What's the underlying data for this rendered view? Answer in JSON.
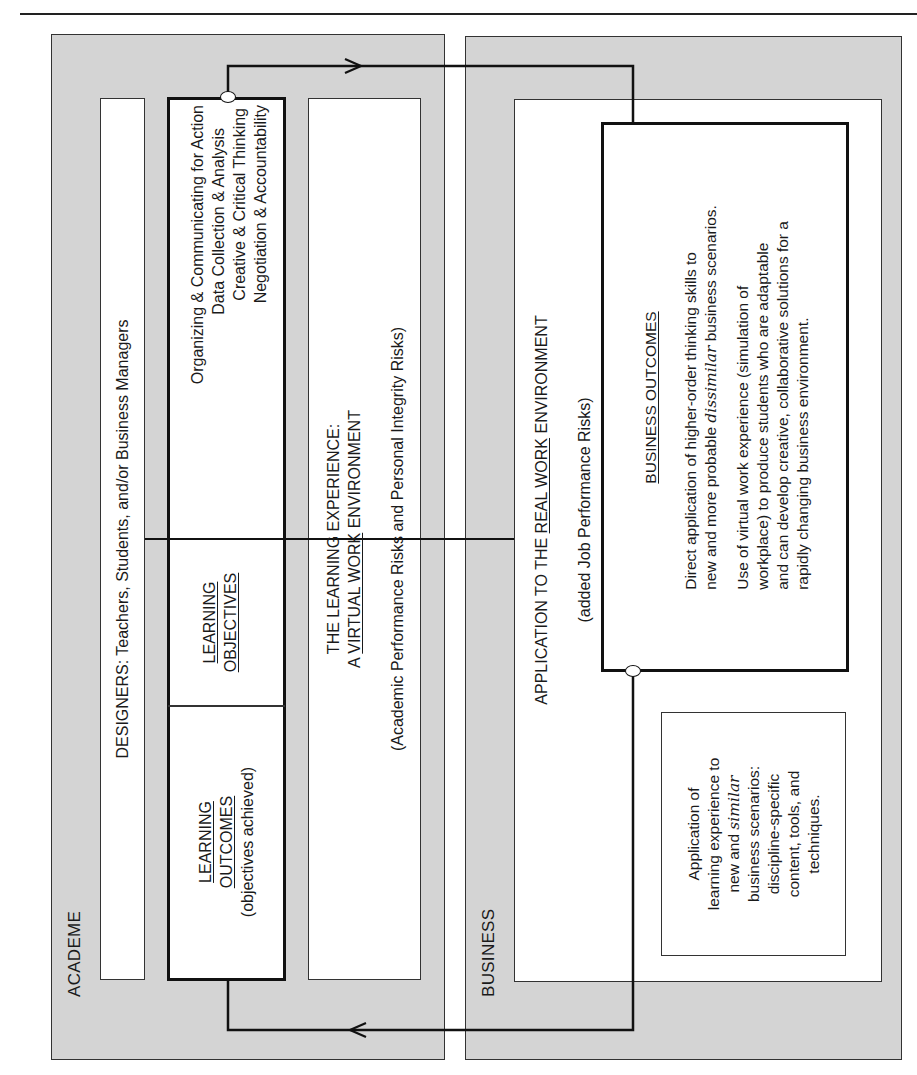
{
  "academe": {
    "label": "ACADEME",
    "designers": "DESIGNERS: Teachers, Students, and/or Business Managers",
    "learning_outcomes": {
      "title_line1": "LEARNING",
      "title_line2": "OUTCOMES",
      "subtitle": "(objectives achieved)"
    },
    "learning_objectives": {
      "title_line1": "LEARNING",
      "title_line2": "OBJECTIVES",
      "items": [
        "Organizing & Communicating for Action",
        "Data Collection & Analysis",
        "Creative & Critical Thinking",
        "Negotiation & Accountability"
      ]
    },
    "learning_experience": {
      "line1": "THE LEARNING EXPERIENCE:",
      "line2_prefix": "A ",
      "line2_underlined": "VIRTUAL WORK",
      "line2_suffix": " ENVIRONMENT",
      "risks": "(Academic Performance Risks and Personal Integrity Risks)"
    }
  },
  "business": {
    "label": "BUSINESS",
    "real_work": {
      "prefix": "APPLICATION TO THE ",
      "underlined": "REAL WORK",
      "suffix": " ENVIRONMENT",
      "risks": "(added Job Performance Risks)"
    },
    "business_outcomes": {
      "title": "BUSINESS OUTCOMES",
      "p1_line1": "Direct application of higher-order thinking skills to",
      "p1_line2_prefix": "new and more probable ",
      "p1_line2_italic": "dissimilar",
      "p1_line2_suffix": " business scenarios.",
      "p2_lines": [
        "Use of virtual work experience (simulation of",
        "workplace) to produce students who are adaptable",
        "and can develop creative, collaborative solutions for a",
        "rapidly changing business environment."
      ]
    },
    "similar_box": {
      "line1": "Application of",
      "line2": "learning experience to",
      "line3_prefix": "new and ",
      "line3_italic": "similar",
      "line4": "business scenarios:",
      "line5": "discipline-specific",
      "line6": "content, tools, and",
      "line7": "techniques."
    }
  },
  "colors": {
    "panel_fill": "#d4d4d4",
    "box_fill": "#ffffff",
    "line": "#111111"
  }
}
